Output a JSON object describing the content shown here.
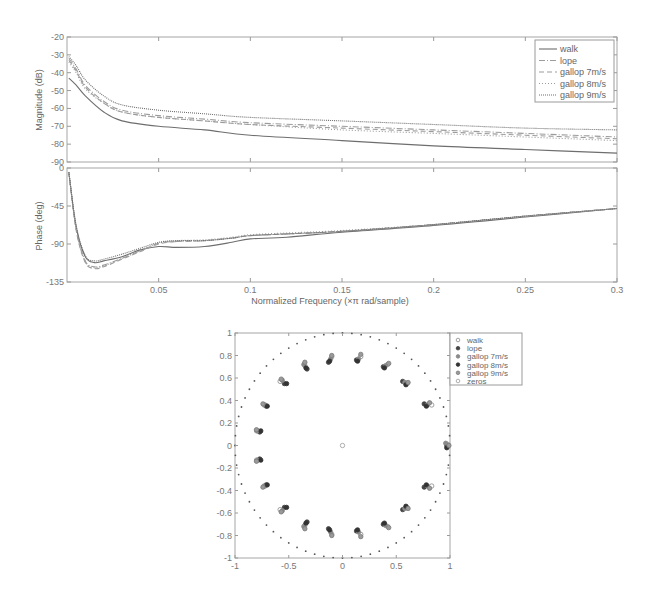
{
  "chart_data": [
    {
      "type": "line",
      "title": "",
      "xlabel": "Normalized Frequency  (×π rad/sample)",
      "ylabel": "Magnitude (dB)",
      "xlim": [
        0,
        0.3
      ],
      "ylim": [
        -90,
        -20
      ],
      "yticks": [
        -20,
        -30,
        -40,
        -50,
        -60,
        -70,
        -80,
        -90
      ],
      "xticks": [
        0.05,
        0.1,
        0.15,
        0.2,
        0.25,
        0.3
      ],
      "grid": false,
      "legend_position": "upper right",
      "x": [
        0.001,
        0.005,
        0.01,
        0.02,
        0.03,
        0.05,
        0.075,
        0.1,
        0.15,
        0.2,
        0.25,
        0.3
      ],
      "series": [
        {
          "name": "walk",
          "style": "solid",
          "values": [
            -43,
            -47,
            -53,
            -62,
            -67,
            -70,
            -72,
            -75,
            -78,
            -81,
            -83,
            -85
          ]
        },
        {
          "name": "lope",
          "style": "dashdot",
          "values": [
            -32,
            -38,
            -47,
            -56,
            -61,
            -64,
            -66,
            -68,
            -70,
            -72,
            -74,
            -76
          ]
        },
        {
          "name": "gallop 7m/s",
          "style": "dashed",
          "values": [
            -33,
            -39,
            -48,
            -57,
            -62,
            -65,
            -67,
            -69,
            -71,
            -73,
            -75,
            -77
          ]
        },
        {
          "name": "gallop 8m/s",
          "style": "dotted",
          "values": [
            -34,
            -40,
            -49,
            -57,
            -62,
            -65,
            -67,
            -69,
            -72,
            -74,
            -76,
            -78
          ]
        },
        {
          "name": "gallop 9m/s",
          "style": "densedot",
          "values": [
            -31,
            -36,
            -44,
            -53,
            -58,
            -61,
            -63,
            -65,
            -67,
            -69,
            -71,
            -72
          ]
        }
      ]
    },
    {
      "type": "line",
      "title": "",
      "xlabel": "Normalized Frequency  (×π rad/sample)",
      "ylabel": "Phase (deg)",
      "xlim": [
        0,
        0.3
      ],
      "ylim": [
        -135,
        0
      ],
      "yticks": [
        0,
        -45,
        -90,
        -135
      ],
      "xticks": [
        0.05,
        0.1,
        0.15,
        0.2,
        0.25,
        0.3
      ],
      "grid": false,
      "x": [
        0.001,
        0.005,
        0.01,
        0.015,
        0.02,
        0.03,
        0.04,
        0.05,
        0.06,
        0.075,
        0.09,
        0.1,
        0.12,
        0.15,
        0.2,
        0.25,
        0.3
      ],
      "series": [
        {
          "name": "walk",
          "values": [
            -5,
            -70,
            -105,
            -112,
            -110,
            -105,
            -97,
            -93,
            -94,
            -93,
            -88,
            -84,
            -82,
            -76,
            -68,
            -58,
            -48
          ]
        },
        {
          "name": "lope",
          "values": [
            -5,
            -72,
            -110,
            -117,
            -115,
            -107,
            -98,
            -89,
            -87,
            -86,
            -83,
            -80,
            -78,
            -75,
            -67,
            -57,
            -48
          ]
        },
        {
          "name": "gallop 7m/s",
          "values": [
            -5,
            -74,
            -112,
            -119,
            -117,
            -108,
            -99,
            -90,
            -87,
            -86,
            -83,
            -80,
            -78,
            -75,
            -67,
            -57,
            -48
          ]
        },
        {
          "name": "gallop 8m/s",
          "values": [
            -5,
            -73,
            -111,
            -118,
            -116,
            -107,
            -98,
            -89,
            -86,
            -85,
            -82,
            -79,
            -77,
            -74,
            -67,
            -57,
            -48
          ]
        },
        {
          "name": "gallop 9m/s",
          "values": [
            -5,
            -68,
            -104,
            -110,
            -108,
            -102,
            -95,
            -88,
            -86,
            -86,
            -83,
            -80,
            -78,
            -75,
            -67,
            -57,
            -48
          ]
        }
      ]
    },
    {
      "type": "scatter",
      "title": "",
      "xlabel": "",
      "ylabel": "",
      "xlim": [
        -1,
        1
      ],
      "ylim": [
        -1,
        1
      ],
      "xticks": [
        -1,
        -0.5,
        0,
        0.5,
        1
      ],
      "yticks": [
        1,
        0.8,
        0.6,
        0.4,
        0.2,
        0,
        -0.2,
        -0.4,
        -0.6,
        -0.8,
        -1
      ],
      "unit_circle": true,
      "legend_position": "outside right",
      "legend": [
        "walk",
        "lope",
        "gallop 7m/s",
        "gallop 8m/s",
        "gallop 9m/s",
        "zeros"
      ],
      "series": [
        {
          "name": "walk",
          "marker": "open-circle",
          "points": [
            [
              0.98,
              0.01
            ],
            [
              0.98,
              -0.01
            ],
            [
              0.83,
              0.36
            ],
            [
              0.83,
              -0.36
            ],
            [
              0.6,
              0.55
            ],
            [
              0.6,
              -0.55
            ],
            [
              0.42,
              0.72
            ],
            [
              0.42,
              -0.72
            ],
            [
              0.17,
              0.79
            ],
            [
              0.17,
              -0.79
            ],
            [
              -0.1,
              0.79
            ],
            [
              -0.1,
              -0.79
            ],
            [
              -0.35,
              0.71
            ],
            [
              -0.35,
              -0.71
            ],
            [
              -0.58,
              0.57
            ],
            [
              -0.58,
              -0.57
            ],
            [
              -0.73,
              0.36
            ],
            [
              -0.73,
              -0.36
            ],
            [
              -0.8,
              0.13
            ],
            [
              -0.8,
              -0.13
            ]
          ]
        },
        {
          "name": "lope",
          "marker": "filled-circle",
          "points": [
            [
              0.97,
              0.0
            ],
            [
              0.76,
              0.37
            ],
            [
              0.76,
              -0.37
            ],
            [
              0.56,
              0.57
            ],
            [
              0.56,
              -0.57
            ],
            [
              0.38,
              0.7
            ],
            [
              0.38,
              -0.7
            ],
            [
              0.13,
              0.76
            ],
            [
              0.13,
              -0.76
            ],
            [
              -0.13,
              0.74
            ],
            [
              -0.13,
              -0.74
            ],
            [
              -0.33,
              0.68
            ],
            [
              -0.33,
              -0.68
            ],
            [
              -0.54,
              0.55
            ],
            [
              -0.54,
              -0.55
            ],
            [
              -0.71,
              0.35
            ],
            [
              -0.71,
              -0.35
            ],
            [
              -0.77,
              0.12
            ],
            [
              -0.77,
              -0.12
            ]
          ]
        },
        {
          "name": "gallop 7m/s",
          "marker": "filled-circle",
          "points": [
            [
              0.96,
              0.02
            ],
            [
              0.79,
              0.36
            ],
            [
              0.79,
              -0.36
            ],
            [
              0.58,
              0.56
            ],
            [
              0.58,
              -0.56
            ],
            [
              0.4,
              0.71
            ],
            [
              0.4,
              -0.71
            ],
            [
              0.15,
              0.77
            ],
            [
              0.15,
              -0.77
            ],
            [
              -0.11,
              0.77
            ],
            [
              -0.11,
              -0.77
            ],
            [
              -0.36,
              0.72
            ],
            [
              -0.36,
              -0.72
            ],
            [
              -0.56,
              0.58
            ],
            [
              -0.56,
              -0.58
            ],
            [
              -0.72,
              0.36
            ],
            [
              -0.72,
              -0.36
            ],
            [
              -0.79,
              0.13
            ],
            [
              -0.79,
              -0.13
            ]
          ]
        },
        {
          "name": "gallop 8m/s",
          "marker": "filled-circle",
          "points": [
            [
              0.97,
              -0.02
            ],
            [
              0.78,
              0.35
            ],
            [
              0.78,
              -0.35
            ],
            [
              0.59,
              0.54
            ],
            [
              0.59,
              -0.54
            ],
            [
              0.39,
              0.69
            ],
            [
              0.39,
              -0.69
            ],
            [
              0.14,
              0.75
            ],
            [
              0.14,
              -0.75
            ],
            [
              -0.12,
              0.75
            ],
            [
              -0.12,
              -0.75
            ],
            [
              -0.34,
              0.69
            ],
            [
              -0.34,
              -0.69
            ],
            [
              -0.52,
              0.55
            ],
            [
              -0.52,
              -0.55
            ],
            [
              -0.7,
              0.35
            ],
            [
              -0.7,
              -0.35
            ],
            [
              -0.76,
              0.13
            ],
            [
              -0.76,
              -0.13
            ]
          ]
        },
        {
          "name": "gallop 9m/s",
          "marker": "filled-circle",
          "points": [
            [
              0.99,
              0.0
            ],
            [
              0.81,
              0.38
            ],
            [
              0.81,
              -0.38
            ],
            [
              0.61,
              0.56
            ],
            [
              0.61,
              -0.56
            ],
            [
              0.43,
              0.73
            ],
            [
              0.43,
              -0.73
            ],
            [
              0.17,
              0.81
            ],
            [
              0.17,
              -0.81
            ],
            [
              -0.1,
              0.8
            ],
            [
              -0.1,
              -0.8
            ],
            [
              -0.35,
              0.74
            ],
            [
              -0.35,
              -0.74
            ],
            [
              -0.57,
              0.59
            ],
            [
              -0.57,
              -0.59
            ],
            [
              -0.74,
              0.37
            ],
            [
              -0.74,
              -0.37
            ],
            [
              -0.8,
              0.14
            ],
            [
              -0.8,
              -0.14
            ]
          ]
        },
        {
          "name": "zeros",
          "marker": "open-circle",
          "points": [
            [
              0,
              0
            ]
          ]
        }
      ]
    }
  ],
  "labels": {
    "mag_ylabel": "Magnitude (dB)",
    "phase_ylabel": "Phase (deg)",
    "xlabel": "Normalized Frequency  (×π rad/sample)"
  },
  "colors": {
    "axis": "#9a9a9a",
    "line_dark": "#6e6e6e",
    "line_light": "#9c9c9c",
    "marker_dark": "#444444",
    "marker_light": "#8a8a8a"
  }
}
